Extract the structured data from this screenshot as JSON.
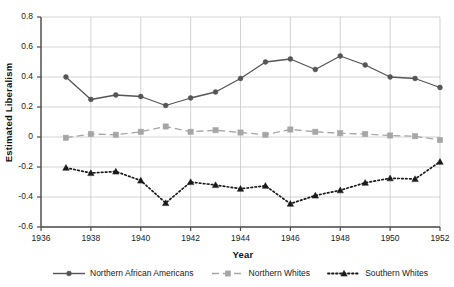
{
  "chart_data": {
    "type": "line",
    "title": "",
    "xlabel": "Year",
    "ylabel": "Estimated Liberalism",
    "xlim": [
      1936,
      1952
    ],
    "ylim": [
      -0.6,
      0.8
    ],
    "grid": true,
    "legend_position": "bottom",
    "x": [
      1937,
      1938,
      1939,
      1940,
      1941,
      1942,
      1943,
      1944,
      1945,
      1946,
      1947,
      1948,
      1949,
      1950,
      1951,
      1952
    ],
    "xticks": [
      "1936",
      "1938",
      "1940",
      "1942",
      "1944",
      "1946",
      "1948",
      "1950",
      "1952"
    ],
    "xtick_values": [
      1936,
      1938,
      1940,
      1942,
      1944,
      1946,
      1948,
      1950,
      1952
    ],
    "yticks": [
      "0.8",
      "0.6",
      "0.4",
      "0.2",
      "0",
      "-0.2",
      "-0.4",
      "-0.6"
    ],
    "ytick_values": [
      0.8,
      0.6,
      0.4,
      0.2,
      0,
      -0.2,
      -0.4,
      -0.6
    ],
    "series": [
      {
        "name": "Northern African Americans",
        "color": "#555555",
        "line_style": "solid",
        "marker": "circle",
        "values": [
          0.4,
          0.25,
          0.28,
          0.27,
          0.21,
          0.26,
          0.3,
          0.39,
          0.5,
          0.52,
          0.45,
          0.54,
          0.48,
          0.4,
          0.39,
          0.33
        ]
      },
      {
        "name": "Northern Whites",
        "color": "#a6a6a6",
        "line_style": "dashed",
        "marker": "square",
        "values": [
          -0.005,
          0.02,
          0.015,
          0.035,
          0.07,
          0.035,
          0.045,
          0.03,
          0.015,
          0.05,
          0.035,
          0.025,
          0.02,
          0.01,
          0.005,
          -0.02
        ]
      },
      {
        "name": "Southern Whites",
        "color": "#1a1a1a",
        "line_style": "dotted",
        "marker": "triangle",
        "values": [
          -0.205,
          -0.24,
          -0.23,
          -0.29,
          -0.44,
          -0.3,
          -0.32,
          -0.345,
          -0.325,
          -0.445,
          -0.39,
          -0.355,
          -0.305,
          -0.275,
          -0.28,
          -0.165
        ]
      }
    ]
  },
  "colors": {
    "axis": "#4d4d4d",
    "grid": "#c8c8c8",
    "background": "#ffffff",
    "text": "#1a1a1a"
  }
}
